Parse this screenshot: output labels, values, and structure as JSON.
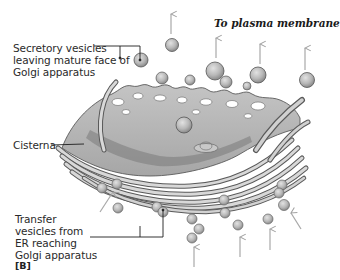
{
  "figure": {
    "panel_label": "[B]",
    "subject": "Golgi apparatus"
  },
  "labels": {
    "secretory": "Secretory vesicles\nleaving mature face of\nGolgi apparatus",
    "plasma_membrane": "To plasma membrane",
    "cisterna": "Cisterna",
    "transfer": "Transfer\nvesicles from\nER reaching\nGolgi apparatus"
  },
  "colors": {
    "golgi_fill": "#b4b4b4",
    "golgi_dark": "#6e6e6e",
    "vesicle_fill": "#bdbdbd",
    "arrow": "#a8a8a8",
    "leader_line": "#1e1e1e",
    "background": "#ffffff"
  },
  "arrows": {
    "outgoing_count": 4,
    "incoming_count": 6
  }
}
